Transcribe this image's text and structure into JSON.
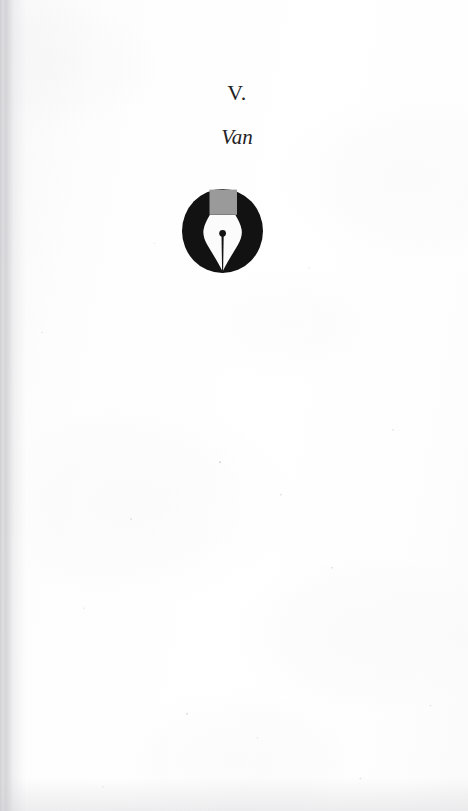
{
  "page": {
    "type": "book-chapter-opener",
    "background_color": "#fdfdfd",
    "ink_color": "#1d1d1f"
  },
  "chapter": {
    "number": "V.",
    "title": "Van"
  },
  "emblem": {
    "name": "fountain-pen-nib-emblem",
    "description": "fountain pen nib inside a filled circle",
    "circle_color": "#121212",
    "grip_color": "#9a9a9a",
    "nib_color": "#fbfbfb",
    "slit_color": "#121212",
    "center_x": 222,
    "center_y": 231,
    "diameter": 81
  }
}
